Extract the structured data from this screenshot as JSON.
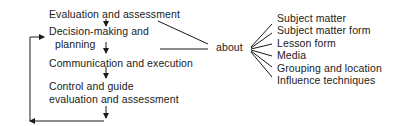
{
  "diagram": {
    "steps": [
      {
        "id": "evaluation",
        "label": "Evaluation and assessment"
      },
      {
        "id": "decision",
        "label_line1": "Decision-making and",
        "label_line2": "planning"
      },
      {
        "id": "communication",
        "label": "Communication and execution"
      },
      {
        "id": "control",
        "label_line1": "Control and guide",
        "label_line2": "evaluation and assessment"
      }
    ],
    "connector_label": "about",
    "topics": [
      "Subject matter",
      "Subject matter form",
      "Lesson  form",
      "Media",
      "Grouping and location",
      "Influence techniques"
    ],
    "line_color": "#1a1a1a"
  }
}
